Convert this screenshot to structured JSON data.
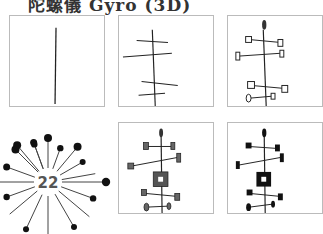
{
  "title": "陀螺儀 Gyro (3D)",
  "panels": [
    {
      "id": "step-1",
      "description": "single vertical stem"
    },
    {
      "id": "step-2",
      "description": "stem with four cross bars"
    },
    {
      "id": "step-3",
      "description": "cross bars with small square ends and pointed top"
    },
    {
      "id": "step-4",
      "description": "starburst badge",
      "badge_number": "22"
    },
    {
      "id": "step-5",
      "description": "shaded ends with center square"
    },
    {
      "id": "step-6",
      "description": "filled black ends with center square"
    }
  ],
  "colors": {
    "ink": "#222222",
    "panel_border": "#bbbbbb",
    "shade": "#555555"
  }
}
